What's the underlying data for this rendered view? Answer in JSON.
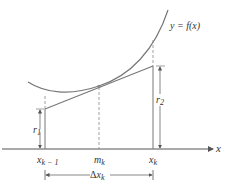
{
  "curve_label": "y = f(x)",
  "axis_label": "x",
  "ticks": {
    "left": {
      "base": "x",
      "sub": "k − 1"
    },
    "mid": {
      "base": "m",
      "sub": "k"
    },
    "right": {
      "base": "x",
      "sub": "k"
    }
  },
  "r1": {
    "base": "r",
    "sub": "1"
  },
  "r2": {
    "base": "r",
    "sub": "2"
  },
  "delta": {
    "symbol": "Δ",
    "base": "x",
    "sub": "k"
  },
  "colors": {
    "line": "#777777",
    "text": "#333333",
    "bg": "#ffffff"
  }
}
